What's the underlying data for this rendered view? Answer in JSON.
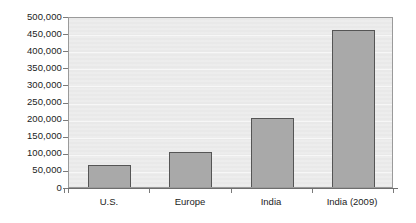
{
  "chart_data": {
    "type": "bar",
    "title": "",
    "subtitle": "",
    "xlabel": "",
    "ylabel": "",
    "categories": [
      "U.S.",
      "Europe",
      "India",
      "India (2009)"
    ],
    "values": [
      65000,
      102000,
      202000,
      460000
    ],
    "series": [
      {
        "name": "",
        "values": [
          65000,
          102000,
          202000,
          460000
        ]
      }
    ],
    "ylim": [
      0,
      500000
    ],
    "ytick_values": [
      0,
      50000,
      100000,
      150000,
      200000,
      250000,
      300000,
      350000,
      400000,
      450000,
      500000
    ],
    "ytick_labels": [
      "0",
      "50,000",
      "100,000",
      "150,000",
      "200,000",
      "250,000",
      "300,000",
      "350,000",
      "400,000",
      "450,000",
      "500,000"
    ],
    "grid": true,
    "grid_orientation": "horizontal",
    "legend": false,
    "legend_position": "none",
    "annotations": [],
    "colors": {
      "bar_fill": "#a9a9a9",
      "bar_border": "#555555",
      "plot_background": "#e9e9e9",
      "plot_border": "#9a9a9a",
      "gridline": "#f7f7f7",
      "axis_line": "#6e6e6e",
      "text": "#1c1c1c",
      "page_background": "#ffffff"
    }
  }
}
